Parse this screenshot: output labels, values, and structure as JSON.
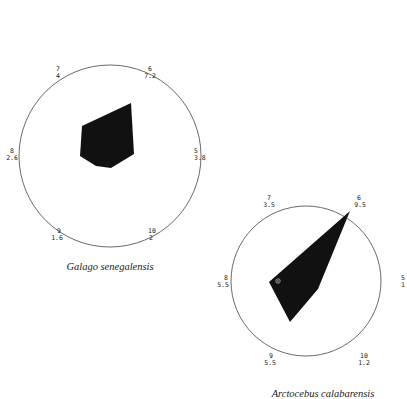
{
  "diagrams": [
    {
      "caption": "Galago senegalensis",
      "circle": {
        "cx": 110,
        "cy": 156,
        "r": 91
      },
      "polygon_points": "82,126 131,103 134,154 111,168 96,166 80,156",
      "labels": [
        {
          "id": "7",
          "value": "4",
          "x": 58,
          "y": 73,
          "anchor": "middle"
        },
        {
          "id": "6",
          "value": "7.2",
          "x": 149,
          "y": 73,
          "anchor": "middle"
        },
        {
          "id": "8",
          "value": "2.6",
          "x": 12,
          "y": 154,
          "anchor": "middle"
        },
        {
          "id": "5",
          "value": "3.8",
          "x": 196,
          "y": 154,
          "anchor": "start"
        },
        {
          "id": "9",
          "value": "1.6",
          "x": 58,
          "y": 234,
          "anchor": "middle"
        },
        {
          "id": "10",
          "value": "2",
          "x": 151,
          "y": 234,
          "anchor": "middle"
        }
      ]
    },
    {
      "caption": "Arctocebus calabarensis",
      "circle": {
        "cx": 306,
        "cy": 281,
        "r": 75
      },
      "polygon_points": "350,211 318,289 290,322 269,282",
      "marker": {
        "x": 278,
        "y": 281
      },
      "labels": [
        {
          "id": "7",
          "value": "3.5",
          "x": 269,
          "y": 196,
          "anchor": "middle"
        },
        {
          "id": "6",
          "value": "9.5",
          "x": 358,
          "y": 196,
          "anchor": "middle"
        },
        {
          "id": "8",
          "value": "5.5",
          "x": 224,
          "y": 278,
          "anchor": "middle"
        },
        {
          "id": "5",
          "value": "1",
          "x": 403,
          "y": 278,
          "anchor": "middle"
        },
        {
          "id": "9",
          "value": "5.5",
          "x": 270,
          "y": 359,
          "anchor": "middle"
        },
        {
          "id": "10",
          "value": "1.2",
          "x": 364,
          "y": 359,
          "anchor": "middle"
        }
      ]
    }
  ]
}
